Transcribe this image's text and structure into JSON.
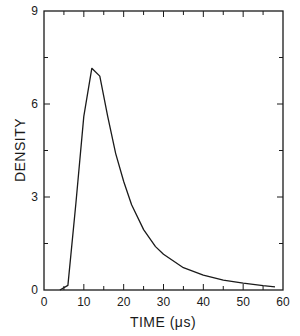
{
  "chart_data": {
    "type": "line",
    "title": "",
    "xlabel": "TIME (μs)",
    "ylabel": "DENSITY",
    "xlim": [
      0,
      60
    ],
    "ylim": [
      0,
      9
    ],
    "x_ticks": [
      0,
      10,
      20,
      30,
      40,
      50,
      60
    ],
    "x_tick_labels": [
      "0",
      "10",
      "20",
      "30",
      "40",
      "50",
      "60"
    ],
    "x_minor_ticks": [
      5,
      15,
      25,
      35,
      45,
      55
    ],
    "y_ticks": [
      0,
      3,
      6,
      9
    ],
    "y_tick_labels": [
      "0",
      "3",
      "6",
      "9"
    ],
    "y_minor_ticks": [
      1.5,
      4.5,
      7.5
    ],
    "grid": false,
    "legend": null,
    "series": [
      {
        "name": "density",
        "x": [
          4,
          6,
          8,
          10,
          12,
          14,
          16,
          18,
          20,
          22,
          25,
          28,
          30,
          35,
          40,
          45,
          50,
          55,
          58
        ],
        "y": [
          0,
          0.15,
          2.8,
          5.6,
          7.15,
          6.9,
          5.6,
          4.4,
          3.5,
          2.75,
          1.95,
          1.4,
          1.15,
          0.72,
          0.48,
          0.32,
          0.22,
          0.14,
          0.1
        ]
      }
    ]
  }
}
